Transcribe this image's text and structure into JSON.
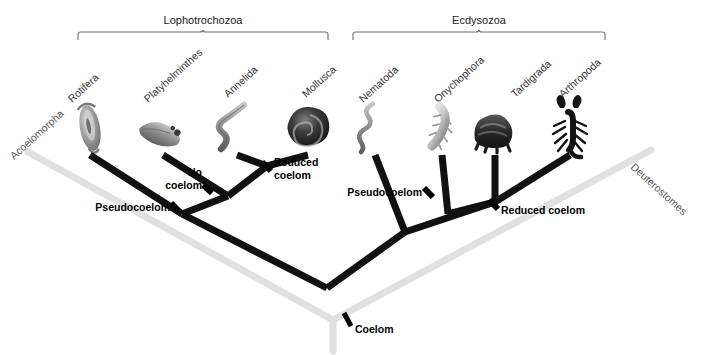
{
  "figure": {
    "type": "cladogram",
    "width": 713,
    "height": 355,
    "background_color": "#ffffff",
    "branch_color": "#111111",
    "outgroup_branch_color": "#dddddd"
  },
  "clades": [
    {
      "id": "lophotrochozoa",
      "label": "Lophotrochozoa",
      "bracket_x1": 78,
      "bracket_x2": 328,
      "bracket_y": 32,
      "label_x": 203,
      "label_y": 24
    },
    {
      "id": "ecdysozoa",
      "label": "Ecdysozoa",
      "bracket_x1": 353,
      "bracket_x2": 605,
      "bracket_y": 32,
      "label_x": 479,
      "label_y": 24
    }
  ],
  "taxa": [
    {
      "id": "acoelomorpha",
      "label": "Acoelomorpha",
      "label_x": 14,
      "label_y": 160,
      "rotate": -42,
      "tip_x": 30,
      "tip_y": 150,
      "silhouette": "none"
    },
    {
      "id": "rotifera",
      "label": "Rotifera",
      "label_x": 72,
      "label_y": 103,
      "rotate": -42,
      "tip_x": 90,
      "tip_y": 155,
      "silhouette": "rotifer"
    },
    {
      "id": "platyhelminthes",
      "label": "Platyhelminthes",
      "label_x": 148,
      "label_y": 103,
      "rotate": -42,
      "tip_x": 163,
      "tip_y": 155,
      "silhouette": "flatworm"
    },
    {
      "id": "annelida",
      "label": "Annelida",
      "label_x": 228,
      "label_y": 98,
      "rotate": -42,
      "tip_x": 237,
      "tip_y": 155,
      "silhouette": "annelid"
    },
    {
      "id": "mollusca",
      "label": "Mollusca",
      "label_x": 306,
      "label_y": 98,
      "rotate": -42,
      "tip_x": 308,
      "tip_y": 155,
      "silhouette": "mollusc"
    },
    {
      "id": "nematoda",
      "label": "Nematoda",
      "label_x": 363,
      "label_y": 103,
      "rotate": -42,
      "tip_x": 375,
      "tip_y": 155,
      "silhouette": "nematode"
    },
    {
      "id": "onychophora",
      "label": "Onychophora",
      "label_x": 438,
      "label_y": 103,
      "rotate": -42,
      "tip_x": 442,
      "tip_y": 155,
      "silhouette": "velvetworm"
    },
    {
      "id": "tardigrada",
      "label": "Tardigrada",
      "label_x": 515,
      "label_y": 98,
      "rotate": -42,
      "tip_x": 495,
      "tip_y": 155,
      "silhouette": "tardigrade"
    },
    {
      "id": "arthropoda",
      "label": "Arthropoda",
      "label_x": 563,
      "label_y": 98,
      "rotate": -42,
      "tip_x": 570,
      "tip_y": 155,
      "silhouette": "scorpion"
    },
    {
      "id": "deuterostomes",
      "label": "Deuterostomes",
      "label_x": 630,
      "label_y": 168,
      "rotate": 42,
      "tip_x": 648,
      "tip_y": 148,
      "silhouette": "none"
    }
  ],
  "trait_marks": [
    {
      "id": "pseudocoelom-left",
      "label": "Pseudocoelom",
      "label_lines": [
        "Pseudocoelom"
      ],
      "mark_x": 175,
      "mark_y": 207,
      "label_x": 170,
      "label_y": 211,
      "anchor": "end"
    },
    {
      "id": "no-coelom",
      "label": "No coelom",
      "label_lines": [
        "No",
        "coelom"
      ],
      "mark_x": 207,
      "mark_y": 189,
      "label_x": 202,
      "label_y": 176,
      "anchor": "end"
    },
    {
      "id": "reduced-coelom-left",
      "label": "Reduced coelom",
      "label_lines": [
        "Reduced",
        "coelom"
      ],
      "mark_x": 266,
      "mark_y": 166,
      "label_x": 272,
      "label_y": 175,
      "anchor": "start"
    },
    {
      "id": "pseudocoelom-right",
      "label": "Pseudocoelom",
      "label_lines": [
        "Pseudocoelom"
      ],
      "mark_x": 428,
      "mark_y": 192,
      "label_x": 423,
      "label_y": 196,
      "anchor": "end"
    },
    {
      "id": "reduced-coelom-right",
      "label": "Reduced coelom",
      "label_lines": [
        "Reduced coelom"
      ],
      "mark_x": 493,
      "mark_y": 204,
      "label_x": 500,
      "label_y": 213,
      "anchor": "start"
    },
    {
      "id": "coelom-root",
      "label": "Coelom",
      "label_lines": [
        "Coelom"
      ],
      "mark_x": 347,
      "mark_y": 320,
      "label_x": 354,
      "label_y": 333,
      "anchor": "start"
    }
  ],
  "nodes": [
    {
      "id": "node-annelida-mollusca",
      "x": 267,
      "y": 166
    },
    {
      "id": "node-platy-clade",
      "x": 228,
      "y": 196
    },
    {
      "id": "node-rotifera-clade",
      "x": 182,
      "y": 214
    },
    {
      "id": "node-tardi-arthro",
      "x": 495,
      "y": 202
    },
    {
      "id": "node-onycho-clade",
      "x": 448,
      "y": 214
    },
    {
      "id": "node-nematoda-clade",
      "x": 405,
      "y": 232
    },
    {
      "id": "node-root-protostome",
      "x": 327,
      "y": 288
    },
    {
      "id": "node-root-bilateria",
      "x": 333,
      "y": 320
    }
  ]
}
